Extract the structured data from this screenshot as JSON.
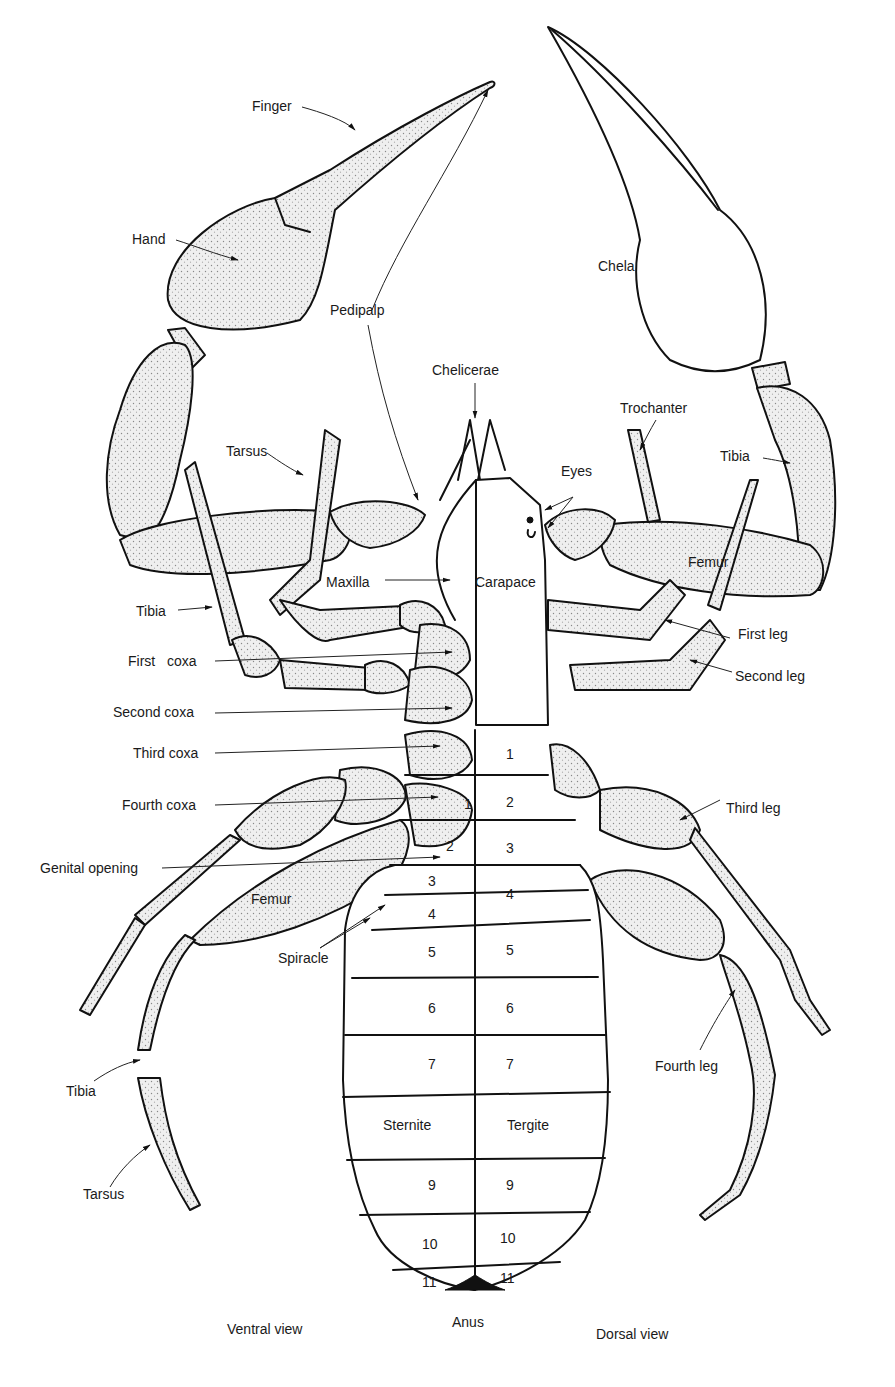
{
  "diagram": {
    "views": {
      "ventral": "Ventral view",
      "dorsal": "Dorsal view"
    },
    "labels": {
      "finger": "Finger",
      "hand": "Hand",
      "pedipalp": "Pedipalp",
      "chela": "Chela",
      "chelicerae": "Chelicerae",
      "trochanter": "Trochanter",
      "tibia_palp": "Tibia",
      "eyes": "Eyes",
      "tarsus_upper": "Tarsus",
      "tibia_leg_left": "Tibia",
      "maxilla": "Maxilla",
      "carapace": "Carapace",
      "femur_right": "Femur",
      "first_leg": "First leg",
      "second_leg": "Second leg",
      "first_coxa": "First   coxa",
      "second_coxa": "Second coxa",
      "third_coxa": "Third coxa",
      "fourth_coxa": "Fourth coxa",
      "genital_opening": "Genital opening",
      "femur_left": "Femur",
      "spiracle": "Spiracle",
      "third_leg": "Third leg",
      "fourth_leg": "Fourth leg",
      "tibia_lower": "Tibia",
      "tarsus_lower": "Tarsus",
      "sternite": "Sternite",
      "tergite": "Tergite",
      "anus": "Anus"
    },
    "ventral_segments": [
      "1",
      "2",
      "3",
      "4",
      "5",
      "6",
      "7",
      "Sternite",
      "9",
      "10",
      "11"
    ],
    "dorsal_segments": [
      "1",
      "2",
      "3",
      "4",
      "5",
      "6",
      "7",
      "Tergite",
      "9",
      "10",
      "11"
    ],
    "colors": {
      "ink": "#111111",
      "background": "#ffffff",
      "stipple": "#e9e9e9"
    }
  }
}
